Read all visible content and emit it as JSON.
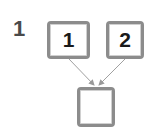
{
  "question": {
    "number": "1"
  },
  "diagram": {
    "type": "number-bond",
    "parts": [
      {
        "label": "part-1",
        "value": "1"
      },
      {
        "label": "part-2",
        "value": "2"
      }
    ],
    "whole": {
      "value": ""
    }
  },
  "colors": {
    "box_border": "#8c8c8c",
    "arrow": "#999999",
    "text": "#1a1a1a",
    "question_number": "#4a4a4a"
  }
}
